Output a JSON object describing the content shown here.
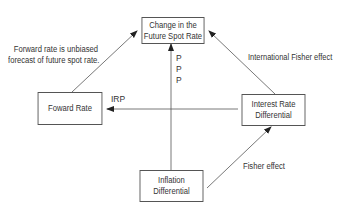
{
  "diagram": {
    "nodes": {
      "spot": {
        "label_line1": "Change in the",
        "label_line2": "Future Spot Rate"
      },
      "forward": {
        "label": "Foward Rate"
      },
      "interest": {
        "label_line1": "Interest Rate",
        "label_line2": "Differential"
      },
      "inflation": {
        "label_line1": "Inflation",
        "label_line2": "Differential"
      }
    },
    "edges": {
      "forward_to_spot": {
        "label_line1": "Forward rate is unbiased",
        "label_line2": "forecast of future spot rate."
      },
      "interest_to_spot": {
        "label": "International Fisher effect"
      },
      "interest_to_forward": {
        "label": "IRP"
      },
      "inflation_to_spot": {
        "label_p1": "P",
        "label_p2": "P",
        "label_p3": "P"
      },
      "inflation_to_interest": {
        "label": "Fisher effect"
      }
    },
    "colors": {
      "line": "#555555",
      "text": "#333333",
      "background": "#ffffff"
    }
  }
}
